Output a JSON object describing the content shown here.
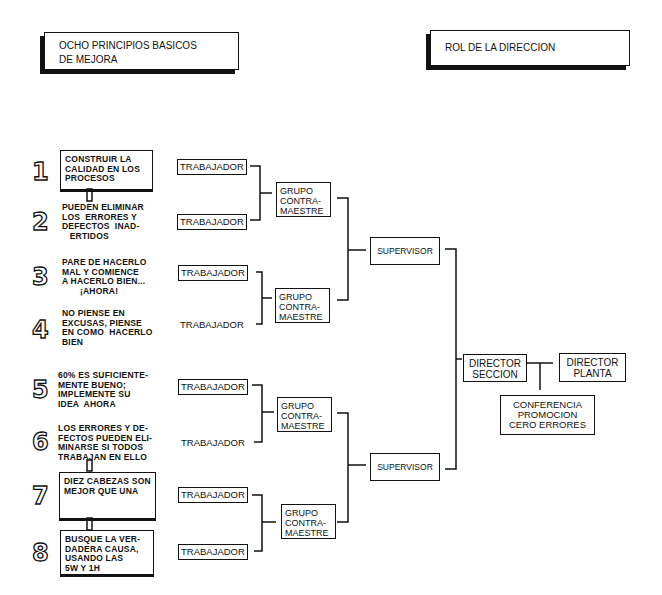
{
  "headers": {
    "left": "OCHO PRINCIPIOS BASICOS\nDE MEJORA",
    "right": "ROL DE LA DIRECCION"
  },
  "principles": [
    {
      "number": "1",
      "text": "CONSTRUIR LA\nCALIDAD EN LOS\nPROCESOS"
    },
    {
      "number": "2",
      "text": "PUEDEN ELIMINAR\nLOS  ERRORES Y\nDEFECTOS  INAD-\n   ERTIDOS"
    },
    {
      "number": "3",
      "text": "PARE DE HACERLO\nMAL Y COMIENCE\nA HACERLO BIEN...\n       ¡AHORA!"
    },
    {
      "number": "4",
      "text": "NO PIENSE EN\nEXCUSAS, PIENSE\nEN COMO  HACERLO\nBIEN"
    },
    {
      "number": "5",
      "text": "60% ES SUFICIENTE-\nMENTE BUENO;\nIMPLEMENTE SU\nIDEA  AHORA"
    },
    {
      "number": "6",
      "text": "LOS ERRORES Y DE-\nFECTOS PUEDEN ELI-\nMINARSE SI TODOS\nTRABAJAN EN ELLO"
    },
    {
      "number": "7",
      "text": "DIEZ CABEZAS SON\nMEJOR QUE UNA"
    },
    {
      "number": "8",
      "text": "BUSQUE LA VER-\nDADERA CAUSA,\nUSANDO LAS\n5W Y 1H"
    }
  ],
  "hierarchy": {
    "workers": [
      "TRABAJADOR",
      "TRABAJADOR",
      "TRABAJADOR",
      "TRABAJADOR",
      "TRABAJADOR",
      "TRABAJADOR",
      "TRABAJADOR",
      "TRABAJADOR"
    ],
    "groups": [
      "GRUPO\nCONTRA-\nMAESTRE",
      "GRUPO\nCONTRA-\nMAESTRE",
      "GRUPO\nCONTRA-\nMAESTRE",
      "GRUPO\nCONTRA-\nMAESTRE"
    ],
    "supervisors": [
      "SUPERVISOR",
      "SUPERVISOR"
    ],
    "director_section": "DIRECTOR\nSECCION",
    "director_plant": "DIRECTOR\nPLANTA",
    "conference": "CONFERENCIA\nPROMOCION\nCERO ERRORES"
  }
}
